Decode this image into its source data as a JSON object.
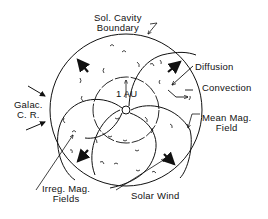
{
  "diagram": {
    "type": "heliosphere-schematic",
    "labels": {
      "cavity_boundary_line1": "Sol. Cavity",
      "cavity_boundary_line2": "Boundary",
      "diffusion": "Diffusion",
      "convection": "Convection",
      "galactic_cr_line1": "Galac.",
      "galactic_cr_line2": "C. R.",
      "au": "1 AU",
      "mean_field_line1": "Mean Mag.",
      "mean_field_line2": "Field",
      "irregular_fields_line1": "Irreg. Mag.",
      "irregular_fields_line2": "Fields",
      "solar_wind": "Solar Wind"
    },
    "colors": {
      "ink": "#111111",
      "background": "#ffffff"
    }
  }
}
